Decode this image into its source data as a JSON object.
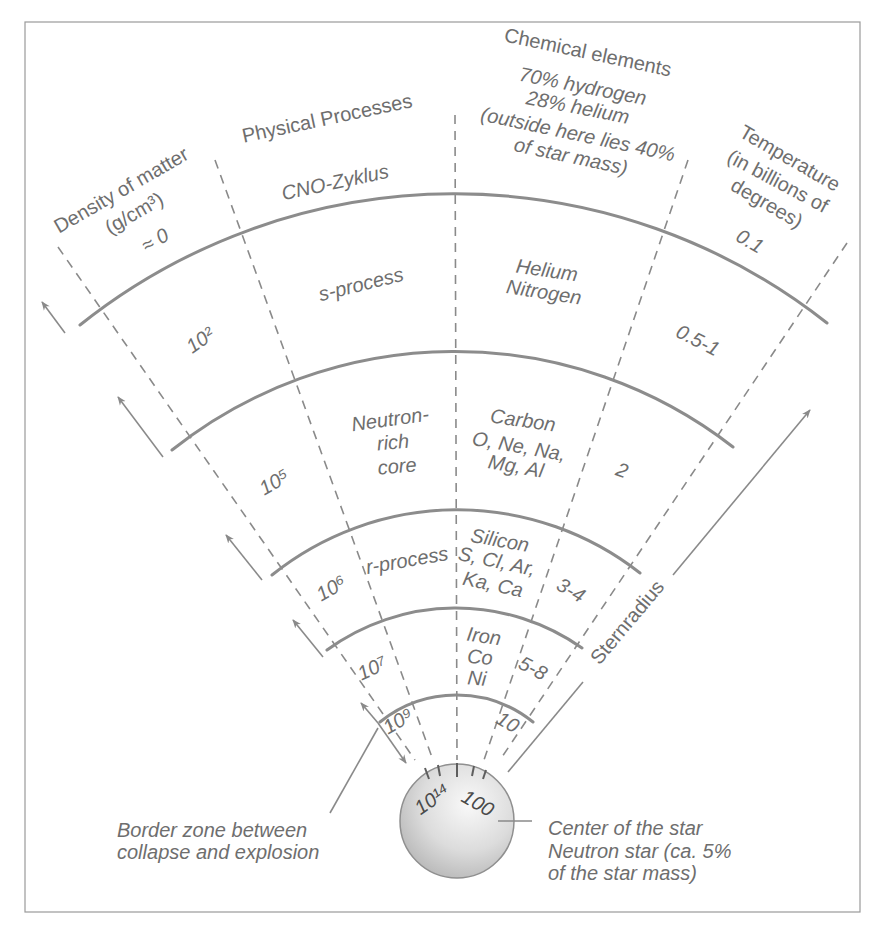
{
  "headers": {
    "density": {
      "title": "Density of matter",
      "unit": "(g/cm³)"
    },
    "processes": {
      "title": "Physical Processes"
    },
    "elements": {
      "title": "Chemical elements",
      "lines": [
        "70% hydrogen",
        "28% helium",
        "(outside here lies 40%",
        "of star mass)"
      ]
    },
    "temperature": {
      "title": "Temperature",
      "unit_lines": [
        "(in billions of",
        "degrees)"
      ]
    }
  },
  "shells": [
    {
      "density": "≈ 0",
      "process": "CNO-Zyklus",
      "temperature": "0.1"
    },
    {
      "density": "10²",
      "process": "s-process",
      "elements": [
        "Helium",
        "Nitrogen"
      ],
      "temperature": "0.5-1"
    },
    {
      "density": "10⁵",
      "process": [
        "Neutron-",
        "rich",
        "core"
      ],
      "elements": [
        "Carbon",
        "O, Ne, Na,",
        "Mg, Al"
      ],
      "temperature": "2"
    },
    {
      "density": "10⁶",
      "process": "r-process",
      "elements": [
        "Silicon",
        "S, Cl, Ar,",
        "Ka, Ca"
      ],
      "temperature": "3-4"
    },
    {
      "density": "10⁷",
      "elements": [
        "Iron",
        "Co",
        "Ni"
      ],
      "temperature": "5-8"
    },
    {
      "density": "10⁹",
      "temperature": "10"
    }
  ],
  "core": {
    "density": "10¹⁴",
    "temperature": "100"
  },
  "annotations": {
    "star_radius": "Sternradius",
    "border_zone": [
      "Border zone between",
      "collapse and explosion"
    ],
    "center": [
      "Center of the star",
      "Neutron star (ca. 5%",
      "of the star mass)"
    ]
  },
  "colors": {
    "line": "#8a8a8a",
    "text": "#6e6e6e",
    "star_light": "#f7f7f7",
    "star_dark": "#b5b5b5"
  }
}
